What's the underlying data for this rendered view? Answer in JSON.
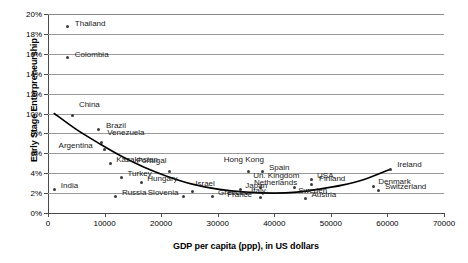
{
  "chart_data": {
    "type": "scatter",
    "title": "",
    "xlabel": "GDP per capita (ppp), in US dollars",
    "ylabel": "Early Stage Enterpreneurship",
    "xlim": [
      0,
      70000
    ],
    "ylim": [
      0,
      20
    ],
    "xticks": [
      0,
      10000,
      20000,
      30000,
      40000,
      50000,
      60000,
      70000
    ],
    "xtick_labels": [
      "0",
      "10000",
      "20000",
      "30000",
      "40000",
      "50000",
      "60000",
      "70000"
    ],
    "yticks": [
      0,
      2,
      4,
      6,
      8,
      10,
      12,
      14,
      16,
      18,
      20
    ],
    "ytick_labels": [
      "0%",
      "2%",
      "4%",
      "6%",
      "8%",
      "10%",
      "12%",
      "14%",
      "16%",
      "18%",
      "20%"
    ],
    "grid": "horizontal",
    "legend": "none",
    "y_unit": "percent",
    "points": [
      {
        "label": "Thailand",
        "x": 3500,
        "y": 18.7,
        "lx": 7,
        "ly": -4
      },
      {
        "label": "Colombia",
        "x": 3500,
        "y": 15.6,
        "lx": 7,
        "ly": -4
      },
      {
        "label": "China",
        "x": 4400,
        "y": 9.8,
        "lx": 6,
        "ly": -11
      },
      {
        "label": "Brazil",
        "x": 9000,
        "y": 8.4,
        "lx": 7,
        "ly": -4
      },
      {
        "label": "Venezuela",
        "x": 9400,
        "y": 7.1,
        "lx": 6,
        "ly": -10
      },
      {
        "label": "Argentina",
        "x": 10000,
        "y": 6.4,
        "lx": -46,
        "ly": -4
      },
      {
        "label": "Kazakhstan",
        "x": 11000,
        "y": 5.0,
        "lx": 6,
        "ly": -4
      },
      {
        "label": "Turkey",
        "x": 13000,
        "y": 3.6,
        "lx": 6,
        "ly": -4
      },
      {
        "label": "Hungary",
        "x": 16500,
        "y": 3.1,
        "lx": 6,
        "ly": -4
      },
      {
        "label": "India",
        "x": 1200,
        "y": 2.4,
        "lx": 6,
        "ly": -4
      },
      {
        "label": "Russia",
        "x": 12000,
        "y": 1.7,
        "lx": 6,
        "ly": -4
      },
      {
        "label": "Slovenia",
        "x": 24000,
        "y": 1.7,
        "lx": -36,
        "ly": -4
      },
      {
        "label": "Israel",
        "x": 25500,
        "y": 2.2,
        "lx": 3,
        "ly": -8
      },
      {
        "label": "Greece",
        "x": 29000,
        "y": 1.7,
        "lx": 6,
        "ly": -4
      },
      {
        "label": "Portugal",
        "x": 21500,
        "y": 4.2,
        "lx": -33,
        "ly": -11
      },
      {
        "label": "Hong Kong",
        "x": 35500,
        "y": 4.2,
        "lx": -25,
        "ly": -12
      },
      {
        "label": "Spain",
        "x": 38000,
        "y": 4.2,
        "lx": 6,
        "ly": -4
      },
      {
        "label": "Japan",
        "x": 34000,
        "y": 2.4,
        "lx": 5,
        "ly": -4
      },
      {
        "label": "Un. Kingdom",
        "x": 37500,
        "y": 2.6,
        "lx": -7,
        "ly": -12
      },
      {
        "label": "Italy",
        "x": 35000,
        "y": 2.0,
        "lx": 5,
        "ly": -3
      },
      {
        "label": "France",
        "x": 37500,
        "y": 1.6,
        "lx": -33,
        "ly": -3
      },
      {
        "label": "Netherlands",
        "x": 43500,
        "y": 2.6,
        "lx": -40,
        "ly": -5
      },
      {
        "label": "USA",
        "x": 46500,
        "y": 3.4,
        "lx": 6,
        "ly": -4
      },
      {
        "label": "Finland",
        "x": 46500,
        "y": 2.9,
        "lx": 8,
        "ly": -6
      },
      {
        "label": "Sweden",
        "x": 46000,
        "y": 2.3,
        "lx": -10,
        "ly": 0
      },
      {
        "label": "Austria",
        "x": 45500,
        "y": 1.5,
        "lx": 6,
        "ly": -4
      },
      {
        "label": "Denmark",
        "x": 57500,
        "y": 2.7,
        "lx": 5,
        "ly": -5
      },
      {
        "label": "Switzerland",
        "x": 58500,
        "y": 2.3,
        "lx": 6,
        "ly": -4
      },
      {
        "label": "Ireland",
        "x": 60500,
        "y": 4.4,
        "lx": 7,
        "ly": -5
      }
    ],
    "trendline": {
      "description": "fitted U-shaped curve",
      "points": [
        {
          "x": 1100,
          "y": 10.0
        },
        {
          "x": 5000,
          "y": 8.4
        },
        {
          "x": 9000,
          "y": 7.0
        },
        {
          "x": 13000,
          "y": 5.7
        },
        {
          "x": 17000,
          "y": 4.6
        },
        {
          "x": 21000,
          "y": 3.7
        },
        {
          "x": 25500,
          "y": 2.9
        },
        {
          "x": 30000,
          "y": 2.4
        },
        {
          "x": 35000,
          "y": 2.1
        },
        {
          "x": 40000,
          "y": 2.0
        },
        {
          "x": 44000,
          "y": 2.1
        },
        {
          "x": 48000,
          "y": 2.4
        },
        {
          "x": 52000,
          "y": 2.8
        },
        {
          "x": 56000,
          "y": 3.4
        },
        {
          "x": 60500,
          "y": 4.4
        }
      ]
    }
  }
}
